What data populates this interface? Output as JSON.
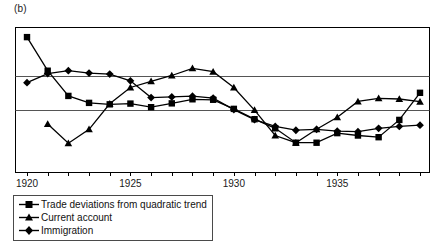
{
  "figure": {
    "panel_label": "(b)",
    "background_color": "#ffffff",
    "frame_color": "#000000",
    "gridline_color": "#555555",
    "series_color": "#000000"
  },
  "legend": {
    "position": "below-axis-left",
    "entries": [
      {
        "label": "Trade deviations from quadratic trend",
        "marker": "square-marker"
      },
      {
        "label": "Current account",
        "marker": "triangle-marker"
      },
      {
        "label": "Immigration",
        "marker": "diamond-marker"
      }
    ]
  },
  "chart_data": {
    "type": "line",
    "title": "",
    "subtitle": "",
    "xlabel": "",
    "ylabel": "",
    "xlim": [
      1920,
      1939
    ],
    "ylim": [
      -3.0,
      3.0
    ],
    "grid": true,
    "gridlines_y": [
      1.0,
      -0.4
    ],
    "legend_position": "below",
    "x": [
      1920,
      1921,
      1922,
      1923,
      1924,
      1925,
      1926,
      1927,
      1928,
      1929,
      1930,
      1931,
      1932,
      1933,
      1934,
      1935,
      1936,
      1937,
      1938,
      1939
    ],
    "xticks": [
      1920,
      1921,
      1922,
      1923,
      1924,
      1925,
      1926,
      1927,
      1928,
      1929,
      1930,
      1931,
      1932,
      1933,
      1934,
      1935,
      1936,
      1937,
      1938,
      1939
    ],
    "xticklabels": [
      "1920",
      "",
      "",
      "",
      "",
      "1925",
      "",
      "",
      "",
      "",
      "1930",
      "",
      "",
      "",
      "",
      "1935",
      "",
      "",
      "",
      ""
    ],
    "series": [
      {
        "name": "Trade deviations from quadratic trend",
        "marker": "square-marker",
        "values": [
          2.62,
          1.22,
          0.17,
          -0.12,
          -0.18,
          -0.15,
          -0.3,
          -0.14,
          0.03,
          0.01,
          -0.37,
          -0.8,
          -1.18,
          -1.78,
          -1.78,
          -1.38,
          -1.48,
          -1.55,
          -0.83,
          0.3
        ]
      },
      {
        "name": "Current account",
        "marker": "triangle-marker",
        "values": [
          null,
          -1.0,
          -1.8,
          -1.22,
          -0.16,
          0.52,
          0.78,
          1.02,
          1.32,
          1.18,
          0.52,
          -0.42,
          -1.48,
          -1.78,
          -1.22,
          -0.72,
          -0.06,
          0.07,
          0.04,
          -0.07
        ]
      },
      {
        "name": "Immigration",
        "marker": "diamond-marker",
        "values": [
          0.72,
          1.1,
          1.22,
          1.12,
          1.08,
          0.8,
          0.1,
          0.13,
          0.16,
          0.08,
          -0.4,
          -0.82,
          -1.1,
          -1.26,
          -1.22,
          -1.3,
          -1.32,
          -1.18,
          -1.1,
          -1.05
        ]
      }
    ]
  }
}
